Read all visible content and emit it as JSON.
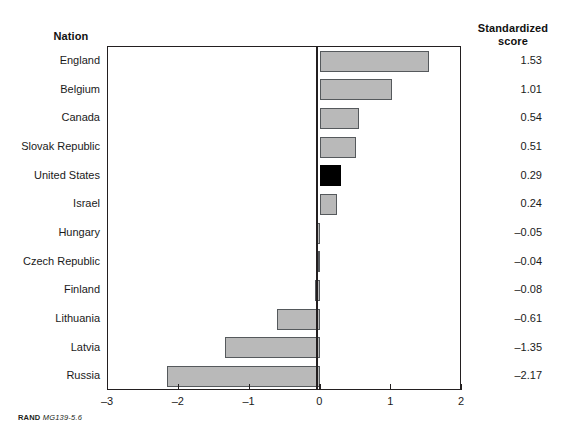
{
  "figure": {
    "column_headers": {
      "nation": "Nation",
      "score_line1": "Standardized",
      "score_line2": "score"
    },
    "footer": {
      "brand": "RAND",
      "doc_id": "MG139-5.6"
    }
  },
  "chart_data": {
    "type": "bar",
    "orientation": "horizontal",
    "title": "",
    "xlabel": "",
    "ylabel": "Nation",
    "xlim": [
      -3,
      2
    ],
    "xticks": [
      -3,
      -2,
      -1,
      0,
      1,
      2
    ],
    "xtick_labels": [
      "–3",
      "–2",
      "–1",
      "0",
      "1",
      "2"
    ],
    "grid": false,
    "legend": null,
    "categories": [
      "England",
      "Belgium",
      "Canada",
      "Slovak Republic",
      "United States",
      "Israel",
      "Hungary",
      "Czech Republic",
      "Finland",
      "Lithuania",
      "Latvia",
      "Russia"
    ],
    "values": [
      1.53,
      1.01,
      0.54,
      0.51,
      0.29,
      0.24,
      -0.05,
      -0.04,
      -0.08,
      -0.61,
      -1.35,
      -2.17
    ],
    "value_labels": [
      "1.53",
      "1.01",
      "0.54",
      "0.51",
      "0.29",
      "0.24",
      "–0.05",
      "–0.04",
      "–0.08",
      "–0.61",
      "–1.35",
      "–2.17"
    ],
    "highlighted_category": "United States",
    "colors": {
      "bar_fill": "#b9b9b9",
      "bar_edge": "#55595c",
      "highlight_fill": "#000000",
      "axis": "#231f20",
      "text": "#1a1a1a"
    }
  }
}
